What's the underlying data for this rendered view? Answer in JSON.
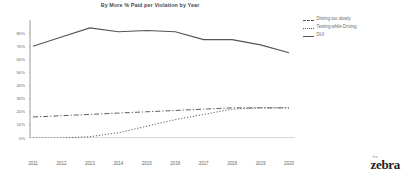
{
  "chart_data": {
    "type": "line",
    "title": "By More % Paid per Violation by Year",
    "xlabel": "",
    "ylabel": "Driving too slowly",
    "categories": [
      "2011",
      "2012",
      "2013",
      "2014",
      "2015",
      "2016",
      "2017",
      "2018",
      "2019",
      "2020"
    ],
    "ylim": [
      0,
      90
    ],
    "xlim_labels": [
      "2011",
      "2020"
    ],
    "grid": false,
    "legend_position": "right",
    "y_ticks": [
      "0%",
      "10%",
      "20%",
      "30%",
      "40%",
      "50%",
      "60%",
      "70%",
      "80%"
    ],
    "y_tick_values": [
      0,
      10,
      20,
      30,
      40,
      50,
      60,
      70,
      80
    ],
    "series": [
      {
        "name": "Driving too slowly",
        "style": "dash-dot",
        "color": "#555555",
        "values": [
          16,
          17,
          18,
          19,
          20,
          21,
          22,
          23,
          23,
          23
        ]
      },
      {
        "name": "Texting while Driving",
        "style": "dotted",
        "color": "#555555",
        "values": [
          0,
          0,
          1,
          4,
          9,
          14,
          18,
          22,
          23,
          23
        ]
      },
      {
        "name": "DUI",
        "style": "solid",
        "color": "#555555",
        "values": [
          70,
          77,
          84,
          81,
          82,
          81,
          75,
          75,
          71,
          65
        ]
      }
    ]
  },
  "legend": {
    "items": [
      {
        "label": "Driving too slowly",
        "style": "dashdot"
      },
      {
        "label": "Texting while Driving",
        "style": "dotted"
      },
      {
        "label": "DUI",
        "style": "solid"
      }
    ]
  },
  "brand": {
    "prefix": "the",
    "name": "zebra"
  }
}
